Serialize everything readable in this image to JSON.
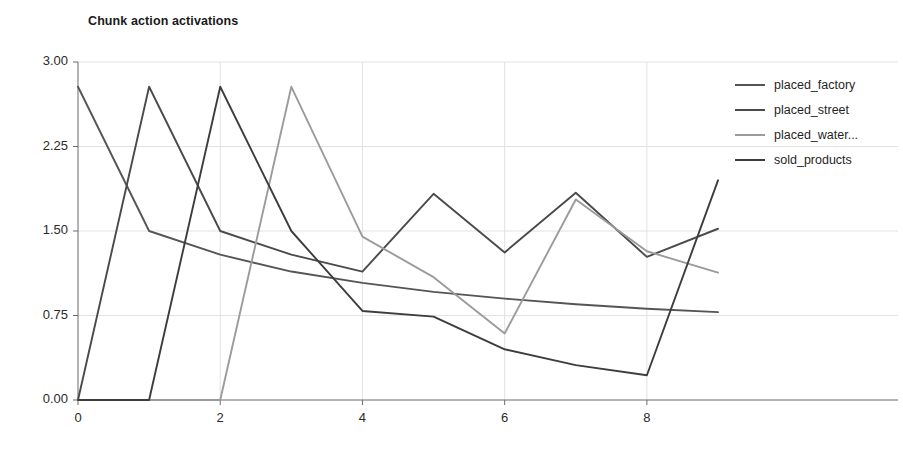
{
  "chart_data": {
    "type": "line",
    "title": "Chunk action activations",
    "xlabel": "",
    "ylabel": "",
    "xlim": [
      0,
      9
    ],
    "ylim": [
      0,
      3.0
    ],
    "xticks": [
      "0",
      "2",
      "4",
      "6",
      "8"
    ],
    "xtick_values": [
      0,
      2,
      4,
      6,
      8
    ],
    "yticks": [
      "0.00",
      "0.75",
      "1.50",
      "2.25",
      "3.00"
    ],
    "ytick_values": [
      0.0,
      0.75,
      1.5,
      2.25,
      3.0
    ],
    "grid": true,
    "legend_position": "right",
    "series": [
      {
        "name": "placed_factory",
        "color": "#555555",
        "x": [
          0,
          1,
          2,
          3,
          4,
          5,
          6,
          7,
          8,
          9
        ],
        "values": [
          2.78,
          1.5,
          1.29,
          1.14,
          1.04,
          0.96,
          0.9,
          0.85,
          0.81,
          0.78
        ]
      },
      {
        "name": "placed_street",
        "color": "#4a4a4a",
        "x": [
          0,
          1,
          2,
          3,
          4,
          5,
          6,
          7,
          8,
          9
        ],
        "values": [
          0.0,
          2.78,
          1.5,
          1.29,
          1.14,
          1.83,
          1.31,
          1.84,
          1.27,
          1.52
        ]
      },
      {
        "name": "placed_water...",
        "color": "#9b9b9b",
        "x": [
          0,
          1,
          2,
          3,
          4,
          5,
          6,
          7,
          8,
          9
        ],
        "values": [
          0.0,
          0.0,
          0.0,
          2.78,
          1.45,
          1.09,
          0.59,
          1.78,
          1.32,
          1.13
        ]
      },
      {
        "name": "sold_products",
        "color": "#3d3d3d",
        "x": [
          0,
          1,
          2,
          3,
          4,
          5,
          6,
          7,
          8,
          9
        ],
        "values": [
          0.0,
          0.0,
          2.78,
          1.5,
          0.79,
          0.74,
          0.45,
          0.31,
          0.22,
          1.95
        ]
      }
    ]
  },
  "legend": {
    "items": [
      {
        "label": "placed_factory"
      },
      {
        "label": "placed_street"
      },
      {
        "label": "placed_water..."
      },
      {
        "label": "sold_products"
      }
    ]
  }
}
